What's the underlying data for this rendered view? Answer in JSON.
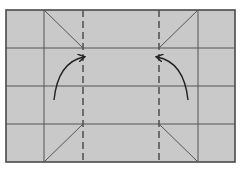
{
  "diagram": {
    "type": "origami-fold-step",
    "paper_color": "#c9c9c9",
    "line_color": "#555555",
    "paper": {
      "x": 6,
      "y": 10,
      "width": 229,
      "height": 152
    },
    "solid_vertical_lines": [
      44,
      198
    ],
    "dashed_valley_folds": [
      83,
      159
    ],
    "horizontal_lines": [
      48,
      86,
      124
    ],
    "diagonal_creases": [
      {
        "x1": 44,
        "y1": 10,
        "x2": 83,
        "y2": 48
      },
      {
        "x1": 198,
        "y1": 10,
        "x2": 159,
        "y2": 48
      },
      {
        "x1": 44,
        "y1": 162,
        "x2": 83,
        "y2": 124
      },
      {
        "x1": 198,
        "y1": 162,
        "x2": 159,
        "y2": 124
      }
    ],
    "arrows": [
      {
        "name": "fold-left-flap-arrow",
        "direction": "right",
        "from": [
          54,
          100
        ],
        "to": [
          86,
          57
        ]
      },
      {
        "name": "fold-right-flap-arrow",
        "direction": "left",
        "from": [
          188,
          100
        ],
        "to": [
          155,
          57
        ]
      }
    ]
  }
}
